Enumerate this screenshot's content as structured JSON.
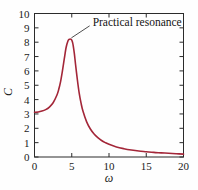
{
  "chart_data": {
    "type": "line",
    "title": "",
    "xlabel": "ω",
    "ylabel": "C",
    "xlim": [
      0,
      20
    ],
    "ylim": [
      0,
      10
    ],
    "grid": false,
    "legend": null,
    "xticks": [
      0,
      5,
      10,
      15,
      20
    ],
    "xtick_labels": [
      "0",
      "5",
      "10",
      "15",
      "20"
    ],
    "yticks": [
      0,
      1,
      2,
      3,
      4,
      5,
      6,
      7,
      8,
      9,
      10
    ],
    "ytick_labels": [
      "0",
      "1",
      "2",
      "3",
      "4",
      "5",
      "6",
      "7",
      "8",
      "9",
      "10"
    ],
    "x_minor_ticks": [
      1,
      2,
      3,
      4,
      6,
      7,
      8,
      9,
      11,
      12,
      13,
      14,
      16,
      17,
      18,
      19
    ],
    "series": [
      {
        "name": "practical resonance curve",
        "color": "#A32638",
        "x": [
          0.0,
          0.5,
          1.0,
          1.5,
          2.0,
          2.5,
          3.0,
          3.25,
          3.5,
          3.75,
          4.0,
          4.25,
          4.5,
          4.65,
          4.8,
          4.9,
          5.0,
          5.1,
          5.2,
          5.35,
          5.5,
          5.75,
          6.0,
          6.25,
          6.5,
          7.0,
          7.5,
          8.0,
          8.5,
          9.0,
          9.5,
          10.0,
          11.0,
          12.0,
          13.0,
          14.0,
          15.0,
          16.0,
          17.0,
          18.0,
          19.0,
          20.0
        ],
        "y": [
          3.12,
          3.14,
          3.2,
          3.3,
          3.48,
          3.78,
          4.3,
          4.7,
          5.25,
          6.0,
          6.85,
          7.65,
          8.1,
          8.2,
          8.22,
          8.2,
          8.15,
          8.0,
          7.75,
          7.2,
          6.5,
          5.4,
          4.45,
          3.75,
          3.2,
          2.45,
          1.95,
          1.6,
          1.35,
          1.15,
          1.0,
          0.88,
          0.7,
          0.58,
          0.49,
          0.42,
          0.37,
          0.32,
          0.29,
          0.26,
          0.23,
          0.2
        ]
      }
    ],
    "annotations": [
      {
        "text": "Practical resonance",
        "target_x": 4.95,
        "target_y": 8.3,
        "label_x": 7.4,
        "label_y": 9.35
      }
    ]
  }
}
